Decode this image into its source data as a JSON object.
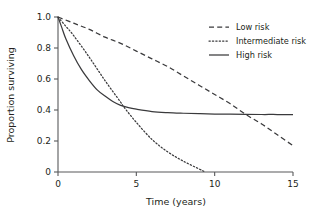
{
  "chart_data": {
    "type": "line",
    "title": "",
    "xlabel": "Time (years)",
    "ylabel": "Proportion surviving",
    "xlim": [
      0,
      15
    ],
    "ylim": [
      0,
      1.0
    ],
    "xticks": [
      0,
      5,
      10,
      15
    ],
    "xtick_labels": [
      "0",
      "5",
      "10",
      "15"
    ],
    "yticks": [
      0,
      0.2,
      0.4,
      0.6,
      0.8,
      1.0
    ],
    "ytick_labels": [
      "0",
      "0.2",
      "0.4",
      "0.6",
      "0.8",
      "1.0"
    ],
    "grid": false,
    "legend_position": "top-right",
    "series": [
      {
        "name": "Low risk",
        "style": "dashed",
        "x": [
          0,
          1,
          2,
          3,
          4,
          5,
          6,
          7,
          8,
          9,
          10,
          11,
          12,
          13,
          14,
          15
        ],
        "values": [
          1.0,
          0.96,
          0.92,
          0.87,
          0.83,
          0.78,
          0.73,
          0.68,
          0.62,
          0.56,
          0.5,
          0.44,
          0.37,
          0.31,
          0.24,
          0.17
        ]
      },
      {
        "name": "Intermediate risk",
        "style": "dotted",
        "x": [
          0,
          0.5,
          1,
          2,
          3,
          4,
          4.2,
          5,
          6,
          7,
          8,
          9,
          9.4
        ],
        "values": [
          1.0,
          0.94,
          0.88,
          0.74,
          0.59,
          0.45,
          0.42,
          0.32,
          0.21,
          0.13,
          0.07,
          0.02,
          0.0
        ]
      },
      {
        "name": "High risk",
        "style": "solid",
        "x": [
          0,
          0.25,
          0.5,
          1,
          1.5,
          2,
          2.5,
          3,
          3.5,
          4,
          4.5,
          5,
          6,
          7,
          8,
          9,
          10,
          11,
          12,
          13,
          14,
          15
        ],
        "values": [
          1.0,
          0.93,
          0.86,
          0.75,
          0.66,
          0.59,
          0.53,
          0.49,
          0.455,
          0.43,
          0.415,
          0.405,
          0.39,
          0.383,
          0.379,
          0.376,
          0.374,
          0.373,
          0.372,
          0.371,
          0.371,
          0.37
        ]
      }
    ],
    "annotations": []
  },
  "legend": {
    "items": [
      {
        "label": "Low risk",
        "style": "dashed"
      },
      {
        "label": "Intermediate risk",
        "style": "dotted"
      },
      {
        "label": "High risk",
        "style": "solid"
      }
    ]
  }
}
